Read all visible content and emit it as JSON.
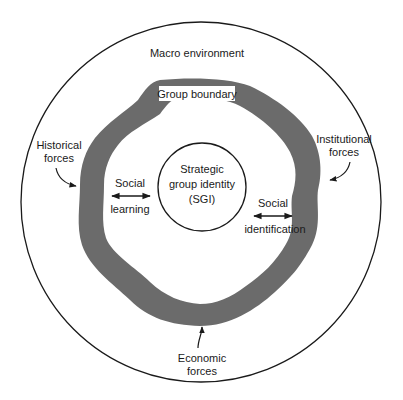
{
  "diagram": {
    "macro_label": "Macro environment",
    "boundary_label": "Group boundary",
    "core": {
      "line1": "Strategic",
      "line2": "group identity",
      "line3": "(SGI)"
    },
    "social_learning": {
      "line1": "Social",
      "line2": "learning"
    },
    "social_identification": {
      "line1": "Social",
      "line2": "identification"
    },
    "forces": {
      "historical": {
        "line1": "Historical",
        "line2": "forces"
      },
      "institutional": {
        "line1": "Institutional",
        "line2": "forces"
      },
      "economic": {
        "line1": "Economic",
        "line2": "forces"
      }
    },
    "colors": {
      "outline": "#1a1a1a",
      "band": "#6b6b6b",
      "background": "#ffffff"
    }
  }
}
